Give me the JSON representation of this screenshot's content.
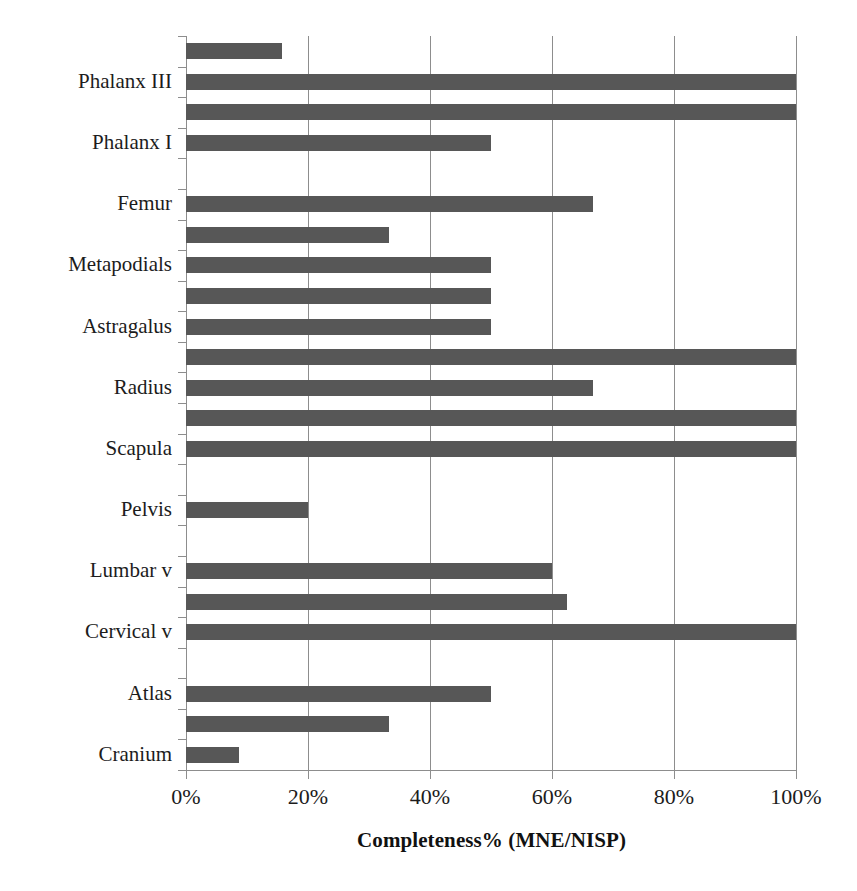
{
  "chart_data": {
    "type": "bar",
    "orientation": "horizontal",
    "title": "",
    "xlabel": "Completeness% (MNE/NISP)",
    "ylabel": "",
    "xlim": [
      0,
      100
    ],
    "xticks": [
      0,
      20,
      40,
      60,
      80,
      100
    ],
    "xticklabels": [
      "0%",
      "20%",
      "40%",
      "60%",
      "80%",
      "100%"
    ],
    "grid": "vertical",
    "legend": "none",
    "bar_color": "#575757",
    "axis_color": "#8d8d8d",
    "categories": [
      "Cranium",
      "Atlas",
      "Cervical v",
      "Lumbar v",
      "Pelvis",
      "Scapula",
      "Radius",
      "Astragalus",
      "Metapodials",
      "Femur",
      "Phalanx I",
      "Phalanx III"
    ],
    "bars_bottom_to_top": [
      {
        "label": "Cranium",
        "labeled": true,
        "value": 8.7
      },
      {
        "label": "",
        "labeled": false,
        "value": 33.3
      },
      {
        "label": "Atlas",
        "labeled": true,
        "value": 50
      },
      {
        "label": "",
        "labeled": false,
        "value": 0
      },
      {
        "label": "Cervical v",
        "labeled": true,
        "value": 100
      },
      {
        "label": "",
        "labeled": false,
        "value": 62.5
      },
      {
        "label": "Lumbar v",
        "labeled": true,
        "value": 60
      },
      {
        "label": "",
        "labeled": false,
        "value": 0
      },
      {
        "label": "Pelvis",
        "labeled": true,
        "value": 20
      },
      {
        "label": "",
        "labeled": false,
        "value": 0
      },
      {
        "label": "Scapula",
        "labeled": true,
        "value": 100
      },
      {
        "label": "",
        "labeled": false,
        "value": 100
      },
      {
        "label": "Radius",
        "labeled": true,
        "value": 66.7
      },
      {
        "label": "",
        "labeled": false,
        "value": 100
      },
      {
        "label": "Astragalus",
        "labeled": true,
        "value": 50
      },
      {
        "label": "",
        "labeled": false,
        "value": 50
      },
      {
        "label": "Metapodials",
        "labeled": true,
        "value": 50
      },
      {
        "label": "",
        "labeled": false,
        "value": 33.3
      },
      {
        "label": "Femur",
        "labeled": true,
        "value": 66.7
      },
      {
        "label": "",
        "labeled": false,
        "value": 0
      },
      {
        "label": "Phalanx I",
        "labeled": true,
        "value": 50
      },
      {
        "label": "",
        "labeled": false,
        "value": 100
      },
      {
        "label": "Phalanx III",
        "labeled": true,
        "value": 100
      },
      {
        "label": "",
        "labeled": false,
        "value": 15.7
      }
    ]
  }
}
